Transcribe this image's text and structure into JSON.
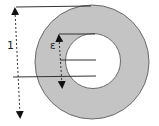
{
  "diagram": {
    "type": "annulus-cross-section",
    "labels": {
      "outer_dimension": "1",
      "thickness": "ε"
    },
    "colors": {
      "ring_fill": "#c4c4c4",
      "ring_stroke": "#6a6a6a",
      "hole_fill": "#ffffff",
      "line": "#333333",
      "background": "#ffffff"
    }
  }
}
